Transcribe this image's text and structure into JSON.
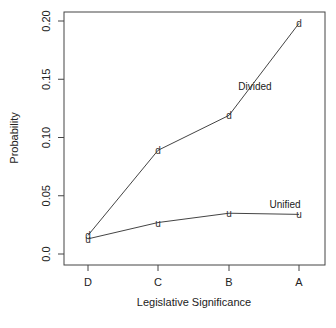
{
  "chart_data": {
    "type": "line",
    "title": "",
    "xlabel": "Legislative Significance",
    "ylabel": "Probability",
    "categories": [
      "D",
      "C",
      "B",
      "A"
    ],
    "ylim": [
      0.0,
      0.2
    ],
    "yticks": [
      "0.0",
      "0.05",
      "0.10",
      "0.15",
      "0.20"
    ],
    "grid": false,
    "legend": "inline labels",
    "series": [
      {
        "name": "Divided",
        "marker": "d",
        "values": [
          0.016,
          0.089,
          0.119,
          0.198
        ]
      },
      {
        "name": "Unified",
        "marker": "u",
        "values": [
          0.013,
          0.027,
          0.035,
          0.034
        ]
      }
    ]
  }
}
